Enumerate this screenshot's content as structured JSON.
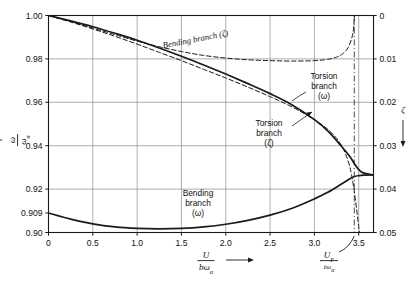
{
  "chart_data": {
    "type": "line",
    "title": "",
    "subtitle": "",
    "xlabel": "U / (bωα)",
    "ylabel_left": "ω / ωα",
    "ylabel_right": "ζ",
    "grid": true,
    "legend": "inline-annotations",
    "xlim": [
      0,
      3.6667
    ],
    "ylim_left": [
      0.9,
      1.0
    ],
    "ylim_right": [
      0.05,
      0.0
    ],
    "x_ticks": [
      "0",
      "0.5",
      "1.0",
      "1.5",
      "2.0",
      "2.5",
      "3.0",
      "3.5"
    ],
    "x_tick_values": [
      0,
      0.5,
      1.0,
      1.5,
      2.0,
      2.5,
      3.0,
      3.5
    ],
    "y_ticks_left": [
      "1.00",
      "0.98",
      "0.96",
      "0.94",
      "0.92",
      "0.909",
      "0.90"
    ],
    "y_tick_values_left": [
      1.0,
      0.98,
      0.96,
      0.94,
      0.92,
      0.909,
      0.9
    ],
    "y_ticks_right": [
      "0",
      "0.01",
      "0.02",
      "0.03",
      "0.04",
      "0.05"
    ],
    "y_tick_values_right": [
      0.0,
      0.01,
      0.02,
      0.03,
      0.04,
      0.05
    ],
    "flutter_speed_label": "U_F / (bωα)",
    "flutter_speed_value": 3.45,
    "series": [
      {
        "name": "Torsion branch (ω)",
        "style": "solid",
        "axis": "left",
        "x": [
          0,
          0.25,
          0.5,
          0.75,
          1.0,
          1.25,
          1.5,
          1.75,
          2.0,
          2.25,
          2.5,
          2.75,
          3.0,
          3.15,
          3.3,
          3.4,
          3.45,
          3.5,
          3.55,
          3.6667
        ],
        "y": [
          1.0,
          0.9975,
          0.9948,
          0.9918,
          0.9886,
          0.985,
          0.9812,
          0.9772,
          0.973,
          0.9686,
          0.964,
          0.9588,
          0.952,
          0.9468,
          0.94,
          0.935,
          0.9318,
          0.929,
          0.9275,
          0.9265
        ]
      },
      {
        "name": "Bending branch (ω)",
        "style": "solid",
        "axis": "left",
        "x": [
          0,
          0.25,
          0.5,
          0.75,
          1.0,
          1.25,
          1.5,
          1.75,
          2.0,
          2.25,
          2.5,
          2.75,
          3.0,
          3.15,
          3.3,
          3.4,
          3.45,
          3.5,
          3.55,
          3.6667
        ],
        "y": [
          0.909,
          0.9062,
          0.904,
          0.9026,
          0.9019,
          0.9017,
          0.9019,
          0.9026,
          0.9038,
          0.9056,
          0.908,
          0.9112,
          0.9155,
          0.9185,
          0.9222,
          0.9248,
          0.9258,
          0.9262,
          0.9264,
          0.9265
        ]
      },
      {
        "name": "Bending branch (ζ)",
        "style": "dashed",
        "axis": "right",
        "x": [
          0,
          0.25,
          0.5,
          0.75,
          1.0,
          1.25,
          1.5,
          1.75,
          2.0,
          2.25,
          2.5,
          2.75,
          3.0,
          3.15,
          3.25,
          3.32,
          3.38,
          3.42,
          3.44,
          3.452
        ],
        "y": [
          0.0,
          0.0014,
          0.0029,
          0.0044,
          0.0059,
          0.0072,
          0.0083,
          0.0092,
          0.0098,
          0.0102,
          0.0104,
          0.0105,
          0.0104,
          0.0101,
          0.0096,
          0.0088,
          0.0074,
          0.0053,
          0.0033,
          0.0
        ]
      },
      {
        "name": "Torsion branch (ζ)",
        "style": "dashed",
        "axis": "right",
        "x": [
          0,
          0.25,
          0.5,
          0.75,
          1.0,
          1.25,
          1.5,
          1.75,
          2.0,
          2.25,
          2.5,
          2.75,
          3.0,
          3.15,
          3.25,
          3.32,
          3.38,
          3.42,
          3.46,
          3.5,
          3.52
        ],
        "y": [
          0.0,
          0.0015,
          0.0031,
          0.0048,
          0.0066,
          0.0085,
          0.0104,
          0.0124,
          0.0144,
          0.0165,
          0.0187,
          0.0211,
          0.024,
          0.0262,
          0.0283,
          0.0305,
          0.0335,
          0.0368,
          0.042,
          0.0487,
          0.052
        ]
      }
    ],
    "annotations": [
      {
        "id": "bending-zeta",
        "text_lines": [
          "Bending branch (ζ)"
        ],
        "rotation": -11
      },
      {
        "id": "torsion-omega",
        "text_lines": [
          "Torsion",
          "branch",
          "(ω)"
        ]
      },
      {
        "id": "torsion-zeta",
        "text_lines": [
          "Torsion",
          "branch",
          "(ζ)"
        ]
      },
      {
        "id": "bending-omega",
        "text_lines": [
          "Bending",
          "branch",
          "(ω)"
        ]
      }
    ],
    "colors": {
      "curve": "#1a1a1a",
      "grid": "#8d8d8d",
      "axis": "#1a1a1a",
      "background": "#ffffff"
    }
  },
  "axis_label_parts": {
    "x_numerator": "U",
    "x_denominator_b": "bω",
    "x_denominator_sub": "α",
    "y_left_num": "ω",
    "y_left_den": "ω",
    "y_left_den_sub": "α",
    "y_right": "ζ",
    "uf_numerator": "U",
    "uf_numerator_sub": "F",
    "uf_denominator": "bω",
    "uf_denominator_sub": "α"
  }
}
